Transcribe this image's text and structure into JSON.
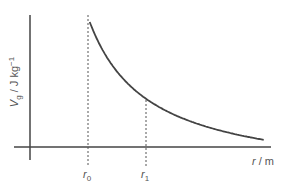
{
  "chart_data": {
    "type": "line",
    "title": "",
    "xlabel": "r / m",
    "ylabel": "V_g / J kg^-1",
    "ylabel_parts": {
      "main": "V",
      "sub": "g",
      "unit": " / J kg",
      "sup": "−1"
    },
    "xlabel_parts": {
      "var": "r",
      "unit": " / m"
    },
    "markers": [
      {
        "name": "r0",
        "label_var": "r",
        "label_sub": "0",
        "x": 1.0
      },
      {
        "name": "r1",
        "label_var": "r",
        "label_sub": "1",
        "x": 2.0
      }
    ],
    "curve": {
      "form": "inverse",
      "description": "V_g ∝ 1/r, starting at r0 and decaying toward the r-axis",
      "x_start": 1.0,
      "x_end": 4.0
    },
    "grid": false,
    "legend": "none"
  }
}
